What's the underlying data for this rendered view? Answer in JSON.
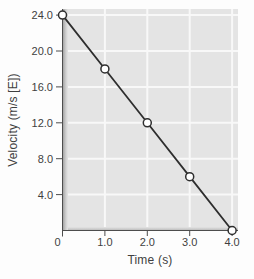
{
  "chart_data": {
    "type": "line",
    "title": "",
    "xlabel": "Time (s)",
    "ylabel": "Velocity (m/s [E])",
    "x": [
      0,
      1.0,
      2.0,
      3.0,
      4.0
    ],
    "y": [
      24.0,
      18.0,
      12.0,
      6.0,
      0.0
    ],
    "xlim": [
      0,
      4
    ],
    "ylim": [
      0,
      24
    ],
    "xtick_values": [
      0,
      1,
      2,
      3,
      4
    ],
    "xtick_labels": [
      "0",
      "1.0",
      "2.0",
      "3.0",
      "4.0"
    ],
    "ytick_values": [
      4,
      8,
      12,
      16,
      20,
      24
    ],
    "ytick_labels": [
      "4.0",
      "8.0",
      "12.0",
      "16.0",
      "20.0",
      "24.0"
    ],
    "grid": true,
    "legend": false,
    "marker": "open-circle",
    "colors": {
      "line": "#2e2e2e",
      "marker_fill": "#ffffff",
      "plot_bg": "#e4e4e4",
      "grid": "#f8f8f8",
      "axis": "#4d4d4d",
      "text": "#3f3f3f",
      "bevel_dark": "#969696",
      "bevel_mid": "#b2b2b2"
    }
  }
}
